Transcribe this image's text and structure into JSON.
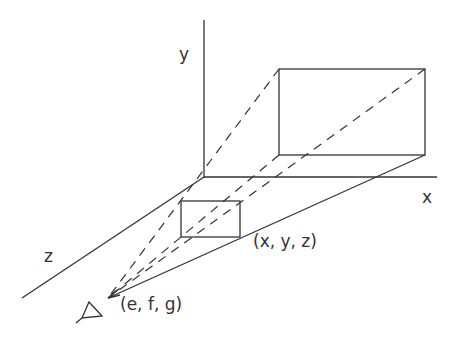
{
  "diagram": {
    "type": "perspective-projection",
    "axes": {
      "y_label": "y",
      "x_label": "x",
      "z_label": "z"
    },
    "points": {
      "object_point_label": "(x, y, z)",
      "eye_point_label": "(e, f, g)"
    },
    "icons": {
      "eye": "eye-triangle-icon"
    },
    "colors": {
      "stroke": "#333333",
      "background": "#ffffff"
    }
  }
}
